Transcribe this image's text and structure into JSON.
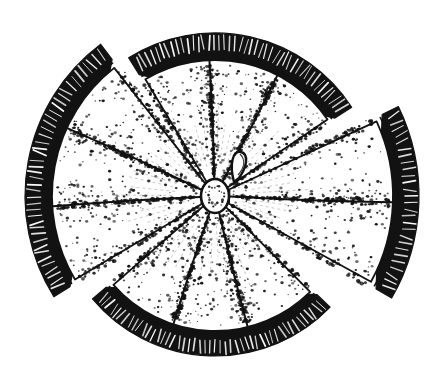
{
  "artwork": {
    "title": "Citrus fruit cross-section, separated into wedges",
    "subject": "citrus-fruit-slice",
    "style": "pen-and-ink engraving line art",
    "medium": "monochrome stipple and hatch drawing",
    "background_color": "#ffffff",
    "ink_color": "#121212",
    "canvas": {
      "width": 434,
      "height": 377
    },
    "center_point": {
      "x": 215,
      "y": 196
    },
    "core": {
      "name": "central-pith-core",
      "shape": "oval",
      "cx": 215,
      "cy": 196,
      "rx": 14,
      "ry": 17,
      "outline": "dotted"
    },
    "seed": {
      "name": "seed-pip",
      "cx": 238,
      "cy": 158,
      "description": "small teardrop pip beside the core"
    },
    "groups": [
      {
        "id": "top",
        "name": "wedge-group-top",
        "label": "Top wedge group",
        "segment_count": 3,
        "start_angle": -122,
        "end_angle": -33,
        "rind_outer": 163,
        "rind_inner": 143,
        "flesh_radius": 136
      },
      {
        "id": "right",
        "name": "wedge-group-right",
        "label": "Right wedge group",
        "segment_count": 2,
        "start_angle": -26,
        "end_angle": 30,
        "rind_outer": 204,
        "rind_inner": 186,
        "flesh_radius": 178
      },
      {
        "id": "bottom",
        "name": "wedge-group-bottom",
        "label": "Bottom wedge group",
        "segment_count": 3,
        "start_angle": 44,
        "end_angle": 140,
        "rind_outer": 160,
        "rind_inner": 142,
        "flesh_radius": 135
      },
      {
        "id": "left",
        "name": "wedge-group-left",
        "label": "Left wedge group",
        "segment_count": 3,
        "start_angle": 148,
        "end_angle": 233,
        "rind_outer": 190,
        "rind_inner": 171,
        "flesh_radius": 163
      }
    ],
    "texture": {
      "flesh": "stippled dots dense near segment borders, sparse at centers",
      "rind": "solid dark band broken by short white dashes",
      "segment_dividers": "radial lines from core to rim"
    }
  }
}
